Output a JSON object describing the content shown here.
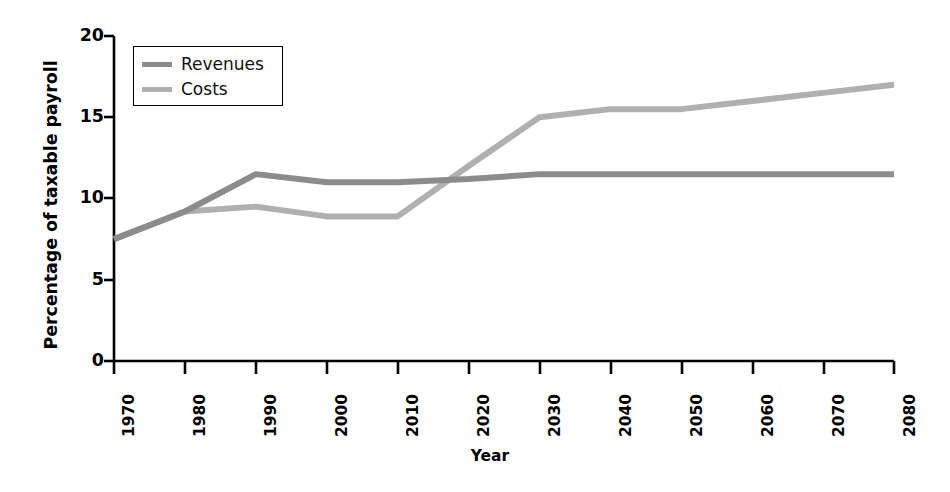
{
  "chart_data": {
    "type": "line",
    "title": "",
    "xlabel": "Year",
    "ylabel": "Percentage of taxable payroll",
    "x": [
      1970,
      1980,
      1990,
      2000,
      2010,
      2020,
      2030,
      2040,
      2050,
      2060,
      2070,
      2080
    ],
    "xlim": [
      1970,
      2080
    ],
    "ylim": [
      0,
      20
    ],
    "xticks": [
      "1970",
      "1980",
      "1990",
      "2000",
      "2010",
      "2020",
      "2030",
      "2040",
      "2050",
      "2060",
      "2070",
      "2080"
    ],
    "yticks": [
      "0",
      "5",
      "10",
      "15",
      "20"
    ],
    "grid": false,
    "legend_position": "upper-left",
    "series": [
      {
        "name": "Revenues",
        "color": "#8c8c8c",
        "values": [
          7.5,
          9.2,
          11.5,
          11.0,
          11.0,
          11.2,
          11.5,
          11.5,
          11.5,
          11.5,
          11.5,
          11.5
        ]
      },
      {
        "name": "Costs",
        "color": "#b0b0b0",
        "values": [
          7.5,
          9.2,
          9.5,
          8.9,
          8.9,
          12.0,
          15.0,
          15.5,
          15.5,
          16.0,
          16.5,
          17.0
        ]
      }
    ],
    "annotations": [
      "Revenues and Costs lines coincide from 1970 to about 1985",
      "Costs cross above Revenues at about 2017"
    ]
  },
  "axis": {
    "y_title": "Percentage of taxable payroll",
    "x_title": "Year",
    "y_labels": [
      "20",
      "15",
      "10",
      "5",
      "0"
    ],
    "x_labels": [
      "1970",
      "1980",
      "1990",
      "2000",
      "2010",
      "2020",
      "2030",
      "2040",
      "2050",
      "2060",
      "2070",
      "2080"
    ]
  },
  "legend": {
    "items": [
      {
        "label": "Revenues",
        "color": "#8c8c8c"
      },
      {
        "label": "Costs",
        "color": "#b0b0b0"
      }
    ]
  },
  "colors": {
    "revenues": "#8c8c8c",
    "costs": "#b0b0b0",
    "axis": "#000000",
    "background": "#ffffff"
  }
}
